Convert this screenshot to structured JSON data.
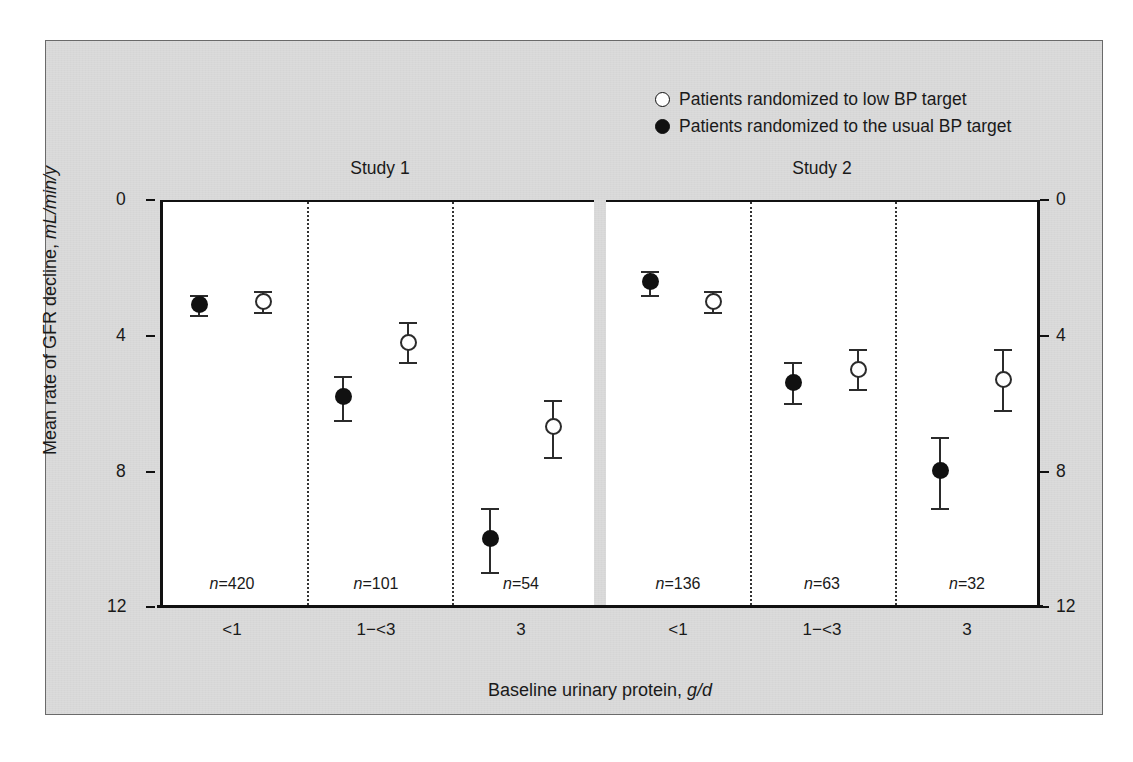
{
  "legend": {
    "items": [
      {
        "marker": "open-circle-icon",
        "label": "Patients randomized to low BP target"
      },
      {
        "marker": "filled-circle-icon",
        "label": "Patients randomized to the usual BP target"
      }
    ]
  },
  "panels": {
    "study1_title": "Study 1",
    "study2_title": "Study 2"
  },
  "axes": {
    "y_title_main": "Mean rate of GFR decline, ",
    "y_title_unit": "mL/min/y",
    "x_title_main": "Baseline urinary protein, ",
    "x_title_unit": "g/d",
    "y_ticks": [
      "0",
      "4",
      "8",
      "12"
    ],
    "y_ticks_right": [
      "0",
      "4",
      "8",
      "12"
    ]
  },
  "categories": [
    "<1",
    "1−<3",
    "3",
    "<1",
    "1−<3",
    "3"
  ],
  "n_labels": [
    "n=420",
    "n=101",
    "n=54",
    "n=136",
    "n=63",
    "n=32"
  ],
  "colors": {
    "panel_background": "#d8d8d8",
    "plot_background": "#ffffff",
    "ink": "#111111"
  },
  "chart_data": {
    "type": "scatter",
    "title": "",
    "xlabel": "Baseline urinary protein, g/d",
    "ylabel": "Mean rate of GFR decline, mL/min/y",
    "ylim": [
      0,
      12
    ],
    "y_inverted": true,
    "grid": false,
    "legend_position": "top-right",
    "panels": [
      "Study 1",
      "Study 2"
    ],
    "categories": [
      "<1",
      "1−<3",
      "3"
    ],
    "series": [
      {
        "name": "Patients randomized to the usual BP target",
        "marker": "filled-circle",
        "points": [
          {
            "panel": "Study 1",
            "category": "<1",
            "n": 420,
            "value": 3.1,
            "ci_low": 2.8,
            "ci_high": 3.4
          },
          {
            "panel": "Study 1",
            "category": "1−<3",
            "n": 101,
            "value": 5.8,
            "ci_low": 5.2,
            "ci_high": 6.5
          },
          {
            "panel": "Study 1",
            "category": "3",
            "n": 54,
            "value": 10.0,
            "ci_low": 9.1,
            "ci_high": 11.0
          },
          {
            "panel": "Study 2",
            "category": "<1",
            "n": 136,
            "value": 2.4,
            "ci_low": 2.1,
            "ci_high": 2.8
          },
          {
            "panel": "Study 2",
            "category": "1−<3",
            "n": 63,
            "value": 5.4,
            "ci_low": 4.8,
            "ci_high": 6.0
          },
          {
            "panel": "Study 2",
            "category": "3",
            "n": 32,
            "value": 8.0,
            "ci_low": 7.0,
            "ci_high": 9.1
          }
        ]
      },
      {
        "name": "Patients randomized to low BP target",
        "marker": "open-circle",
        "points": [
          {
            "panel": "Study 1",
            "category": "<1",
            "n": 420,
            "value": 3.0,
            "ci_low": 2.7,
            "ci_high": 3.3
          },
          {
            "panel": "Study 1",
            "category": "1−<3",
            "n": 101,
            "value": 4.2,
            "ci_low": 3.6,
            "ci_high": 4.8
          },
          {
            "panel": "Study 1",
            "category": "3",
            "n": 54,
            "value": 6.7,
            "ci_low": 5.9,
            "ci_high": 7.6
          },
          {
            "panel": "Study 2",
            "category": "<1",
            "n": 136,
            "value": 3.0,
            "ci_low": 2.7,
            "ci_high": 3.3
          },
          {
            "panel": "Study 2",
            "category": "1−<3",
            "n": 63,
            "value": 5.0,
            "ci_low": 4.4,
            "ci_high": 5.6
          },
          {
            "panel": "Study 2",
            "category": "3",
            "n": 32,
            "value": 5.3,
            "ci_low": 4.4,
            "ci_high": 6.2
          }
        ]
      }
    ]
  }
}
